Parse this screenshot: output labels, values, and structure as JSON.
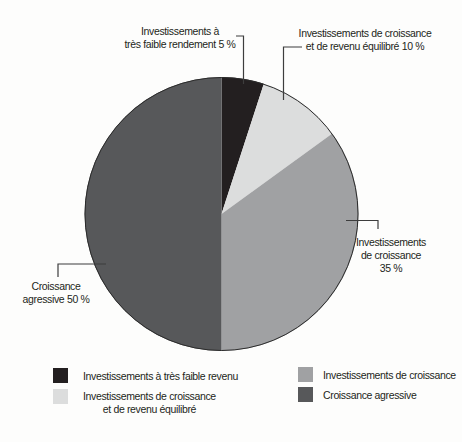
{
  "chart_data": {
    "type": "pie",
    "title": "",
    "start_angle_deg": 0,
    "direction": "clockwise",
    "legend_position": "bottom",
    "slices": [
      {
        "label": "Investissements à très faible rendement",
        "value": 5,
        "pct_label": "5 %",
        "color": "#231f20"
      },
      {
        "label": "Investissements de croissance et de revenu équilibré",
        "value": 10,
        "pct_label": "10 %",
        "color": "#dcdddd"
      },
      {
        "label": "Investissements de croissance",
        "value": 35,
        "pct_label": "35 %",
        "color": "#a0a1a3"
      },
      {
        "label": "Croissance agressive",
        "value": 50,
        "pct_label": "50 %",
        "color": "#57585a"
      }
    ],
    "outline_color": "#2b2b2b"
  },
  "callouts": {
    "low_yield": [
      "Investissements à",
      "très faible rendement 5 %"
    ],
    "balanced": [
      "Investissements de croissance",
      "et de revenu équilibré 10 %"
    ],
    "growth": [
      "Investissements",
      "de croissance",
      "35 %"
    ],
    "aggressive": [
      "Croissance",
      "agressive 50 %"
    ]
  },
  "legend": {
    "items": [
      {
        "color": "#231f20",
        "lines": [
          "Investissements à très faible revenu"
        ]
      },
      {
        "color": "#dcdddd",
        "lines": [
          "Investissements de croissance",
          "et de revenu équilibré"
        ]
      },
      {
        "color": "#a0a1a3",
        "lines": [
          "Investissements de croissance"
        ]
      },
      {
        "color": "#57585a",
        "lines": [
          "Croissance agressive"
        ]
      }
    ]
  }
}
